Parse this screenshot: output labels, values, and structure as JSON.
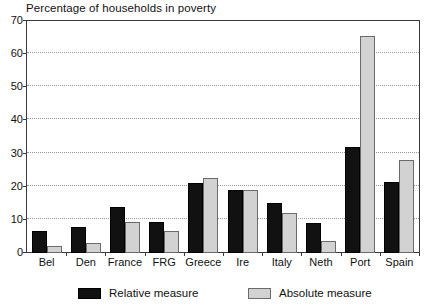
{
  "chart_data": {
    "type": "bar",
    "title": "Percentage of households in poverty",
    "xlabel": "",
    "ylabel": "",
    "ylim": [
      0,
      70
    ],
    "yticks": [
      0,
      10,
      20,
      30,
      40,
      50,
      60,
      70
    ],
    "grid": true,
    "legend_position": "bottom",
    "categories": [
      "Bel",
      "Den",
      "France",
      "FRG",
      "Greece",
      "Ire",
      "Italy",
      "Neth",
      "Port",
      "Spain"
    ],
    "series": [
      {
        "name": "Relative measure",
        "color": "#111111",
        "values": [
          6.5,
          8,
          14,
          9.5,
          21,
          19,
          15,
          9,
          32,
          21.5
        ]
      },
      {
        "name": "Absolute measure",
        "color": "#d2d2d2",
        "values": [
          2,
          3,
          9.5,
          6.5,
          22.5,
          19,
          12,
          3.5,
          65.5,
          28
        ]
      }
    ]
  },
  "legend": {
    "entries": [
      {
        "label": "Relative measure"
      },
      {
        "label": "Absolute measure"
      }
    ]
  }
}
